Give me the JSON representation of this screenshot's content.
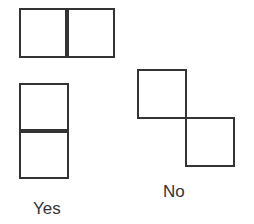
{
  "diagram": {
    "title": "",
    "groups": [
      {
        "id": "horizontal-pair",
        "shape": "two squares side by side sharing an edge"
      },
      {
        "id": "vertical-pair",
        "shape": "two squares stacked sharing an edge",
        "label": "Yes"
      },
      {
        "id": "diagonal-pair",
        "shape": "two squares touching only at a corner",
        "label": "No"
      }
    ],
    "labels": {
      "yes": "Yes",
      "no": "No"
    },
    "colors": {
      "stroke": "#333333",
      "background": "#ffffff"
    }
  }
}
